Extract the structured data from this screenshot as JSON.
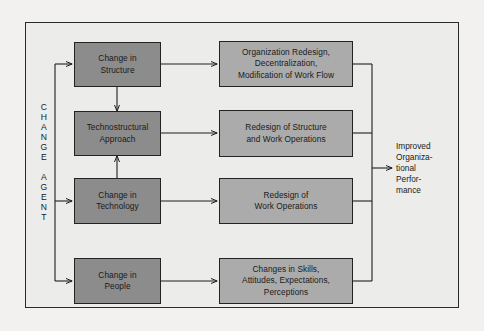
{
  "figure": {
    "kind": "flow-diagram",
    "background_color": "#ececeb",
    "page_color": "#f2f1ef",
    "frame_border_color": "#2a2a2a",
    "left_node_fill": "#8c8c8c",
    "right_node_fill": "#ababab",
    "line_color": "#1f1f1f"
  },
  "agent": {
    "label": "C\nH\nA\nN\nG\nE\n\nA\nG\nE\nN\nT"
  },
  "interventions": [
    {
      "id": "structure",
      "label": "Change in\nStructure"
    },
    {
      "id": "technostructural",
      "label": "Technostructural\nApproach"
    },
    {
      "id": "technology",
      "label": "Change in\nTechnology"
    },
    {
      "id": "people",
      "label": "Change in\nPeople"
    }
  ],
  "outcomes": [
    {
      "id": "org-redesign",
      "label": "Organization Redesign,\nDecentralization,\nModification of Work Flow"
    },
    {
      "id": "redesign-struct",
      "label": "Redesign of Structure\nand Work Operations"
    },
    {
      "id": "redesign-work",
      "label": "Redesign of\nWork Operations"
    },
    {
      "id": "changes-skills",
      "label": "Changes in Skills,\nAttitudes, Expectations,\nPerceptions"
    }
  ],
  "result": {
    "label": "Improved\nOrganiza-\ntional\nPerfor-\nmance"
  }
}
